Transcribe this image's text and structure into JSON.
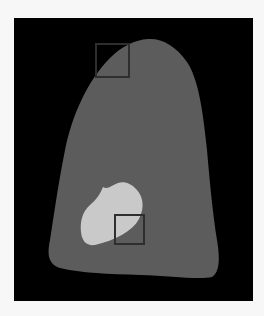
{
  "figure": {
    "colors": {
      "page_background": "#f7f7f7",
      "panel_background": "#000000",
      "organ_fill": "#5c5c5c",
      "lesion_fill": "#c9c9c9",
      "roi_stroke": "#2e2e2e"
    },
    "panel": {
      "x": 14,
      "y": 18,
      "width": 239,
      "height": 283
    },
    "regions_of_interest": [
      {
        "id": "roi-top",
        "x": 96,
        "y": 44,
        "width": 33,
        "height": 33
      },
      {
        "id": "roi-bottom",
        "x": 115,
        "y": 215,
        "width": 29,
        "height": 29
      }
    ]
  }
}
